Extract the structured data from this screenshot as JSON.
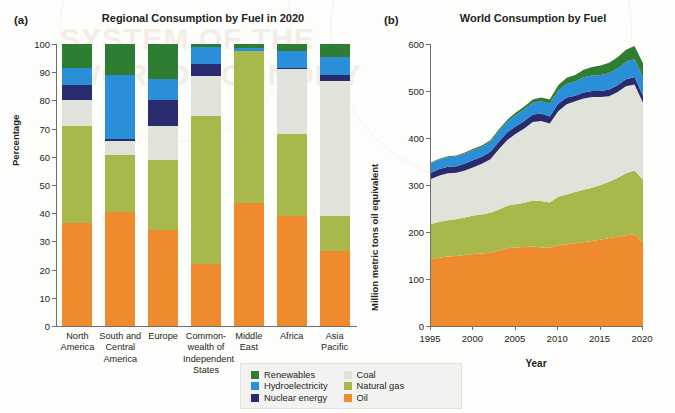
{
  "figure": {
    "watermark_line1": "SYSTEM OF THE",
    "watermark_line2": "WORLD ECONOMY"
  },
  "panel_a": {
    "tag": "(a)",
    "title": "Regional Consumption by Fuel in 2020"
  },
  "panel_b": {
    "tag": "(b)",
    "title": "World Consumption by Fuel"
  },
  "legend": {
    "left_column": [
      {
        "label": "Renewables",
        "color": "#2f7d32"
      },
      {
        "label": "Hydroelectricity",
        "color": "#2a8fd8"
      },
      {
        "label": "Nuclear energy",
        "color": "#2a2a6e"
      }
    ],
    "right_column": [
      {
        "label": "Coal",
        "color": "#dfe3da"
      },
      {
        "label": "Natural gas",
        "color": "#a8b84a"
      },
      {
        "label": "Oil",
        "color": "#f08a2e"
      }
    ]
  },
  "colors": {
    "renewables": "#2f7d32",
    "hydroelectricity": "#2a8fd8",
    "nuclear": "#2a2a6e",
    "coal": "#dfe3da",
    "natural_gas": "#a8b84a",
    "oil": "#f08a2e",
    "axis": "#6d6e71",
    "text": "#231f20"
  },
  "chart_data": [
    {
      "id": "a",
      "type": "bar",
      "stacked": true,
      "title": "Regional Consumption by Fuel in 2020",
      "xlabel": "",
      "ylabel": "Percentage",
      "ylim": [
        0,
        100
      ],
      "yticks": [
        0,
        10,
        20,
        30,
        40,
        50,
        60,
        70,
        80,
        90,
        100
      ],
      "grid": false,
      "legend_position": "bottom-center",
      "categories": [
        "North America",
        "South and Central America",
        "Europe",
        "Commonwealth of Independent States",
        "Middle East",
        "Africa",
        "Asia Pacific"
      ],
      "category_label_lines": [
        [
          "North",
          "America"
        ],
        [
          "South and",
          "Central",
          "America"
        ],
        [
          "Europe"
        ],
        [
          "Common-",
          "wealth of",
          "Independent",
          "States"
        ],
        [
          "Middle",
          "East"
        ],
        [
          "Africa"
        ],
        [
          "Asia",
          "Pacific"
        ]
      ],
      "series": [
        {
          "name": "Oil",
          "color": "#f08a2e",
          "values": [
            36.5,
            40.5,
            34.0,
            22.0,
            43.5,
            39.0,
            26.5
          ]
        },
        {
          "name": "Natural gas",
          "color": "#a8b84a",
          "values": [
            34.3,
            20.0,
            25.0,
            52.5,
            54.0,
            29.0,
            12.5
          ]
        },
        {
          "name": "Coal",
          "color": "#dfe3da",
          "values": [
            9.2,
            5.0,
            12.0,
            14.0,
            0.0,
            23.0,
            48.0
          ]
        },
        {
          "name": "Nuclear energy",
          "color": "#2a2a6e",
          "values": [
            5.5,
            0.8,
            9.0,
            4.5,
            0.0,
            0.5,
            2.0
          ]
        },
        {
          "name": "Hydroelectricity",
          "color": "#2a8fd8",
          "values": [
            6.0,
            22.7,
            7.5,
            6.0,
            1.2,
            6.0,
            6.5
          ]
        },
        {
          "name": "Renewables",
          "color": "#2f7d32",
          "values": [
            8.5,
            11.0,
            12.5,
            1.0,
            1.3,
            2.5,
            4.5
          ]
        }
      ]
    },
    {
      "id": "b",
      "type": "area",
      "stacked": true,
      "title": "World Consumption by Fuel",
      "xlabel": "Year",
      "ylabel": "Million metric tons oil equivalent",
      "ylim": [
        0,
        600
      ],
      "yticks": [
        0,
        100,
        200,
        300,
        400,
        500,
        600
      ],
      "xlim": [
        1995,
        2020
      ],
      "xticks": [
        1995,
        2000,
        2005,
        2010,
        2015,
        2020
      ],
      "grid": false,
      "x": [
        1995,
        1996,
        1997,
        1998,
        1999,
        2000,
        2001,
        2002,
        2003,
        2004,
        2005,
        2006,
        2007,
        2008,
        2009,
        2010,
        2011,
        2012,
        2013,
        2014,
        2015,
        2016,
        2017,
        2018,
        2019,
        2020
      ],
      "series": [
        {
          "name": "Oil",
          "color": "#f08a2e",
          "values": [
            142,
            145,
            148,
            149,
            151,
            153,
            154,
            156,
            160,
            166,
            167,
            168,
            169,
            167,
            167,
            171,
            174,
            176,
            178,
            181,
            184,
            187,
            190,
            193,
            195,
            177
          ]
        },
        {
          "name": "Natural gas",
          "color": "#a8b84a",
          "values": [
            75,
            77,
            77,
            78,
            80,
            82,
            83,
            85,
            88,
            90,
            92,
            94,
            98,
            99,
            96,
            104,
            106,
            109,
            112,
            113,
            116,
            120,
            125,
            132,
            136,
            134
          ]
        },
        {
          "name": "Coal",
          "color": "#dfe3da",
          "values": [
            96,
            98,
            100,
            99,
            100,
            103,
            108,
            114,
            128,
            140,
            150,
            158,
            167,
            170,
            168,
            182,
            192,
            193,
            194,
            193,
            187,
            182,
            183,
            185,
            183,
            164
          ]
        },
        {
          "name": "Nuclear energy",
          "color": "#2a2a6e",
          "values": [
            13,
            14,
            14,
            14,
            15,
            15,
            15,
            16,
            16,
            16,
            16,
            16,
            16,
            16,
            15,
            16,
            14,
            12,
            13,
            13,
            13,
            14,
            14,
            15,
            16,
            15
          ]
        },
        {
          "name": "Hydroelectricity",
          "color": "#2a8fd8",
          "values": [
            20,
            20,
            20,
            21,
            21,
            21,
            21,
            21,
            22,
            23,
            24,
            25,
            25,
            26,
            27,
            28,
            29,
            30,
            32,
            33,
            34,
            35,
            36,
            37,
            38,
            39
          ]
        },
        {
          "name": "Renewables",
          "color": "#2f7d32",
          "values": [
            2,
            2,
            2,
            2,
            2,
            3,
            3,
            3,
            4,
            4,
            5,
            6,
            7,
            8,
            9,
            11,
            13,
            14,
            16,
            18,
            20,
            22,
            24,
            26,
            28,
            30
          ]
        }
      ]
    }
  ]
}
